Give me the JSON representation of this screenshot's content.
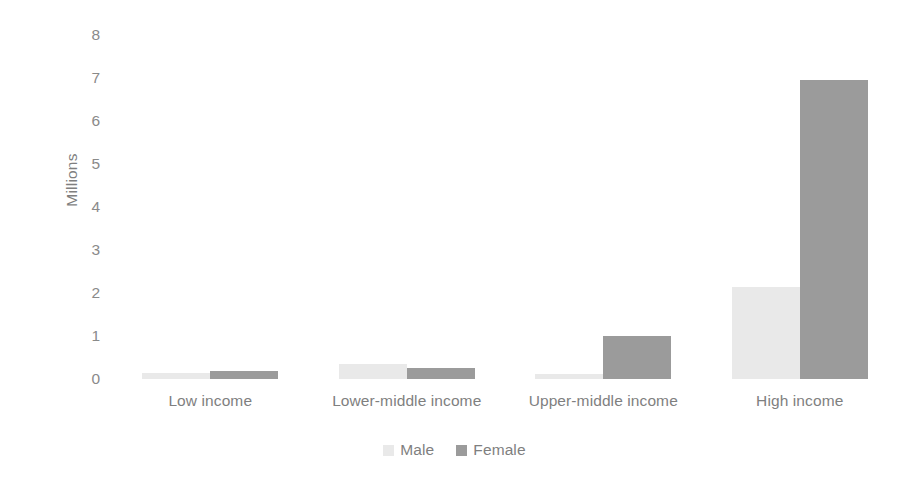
{
  "chart_data": {
    "type": "bar",
    "title": "",
    "subtitle": "",
    "xlabel": "",
    "ylabel": "Millions",
    "ylim": [
      0,
      8
    ],
    "yticks": [
      0,
      1,
      2,
      3,
      4,
      5,
      6,
      7,
      8
    ],
    "ytick_labels": [
      "0",
      "1",
      "2",
      "3",
      "4",
      "5",
      "6",
      "7",
      "8"
    ],
    "grid": false,
    "legend_position": "bottom-center",
    "categories": [
      "Low income",
      "Lower-middle income",
      "Upper-middle income",
      "High income"
    ],
    "series": [
      {
        "name": "Male",
        "color": "#e9e9e9",
        "values": [
          0.13,
          0.35,
          0.12,
          2.15
        ]
      },
      {
        "name": "Female",
        "color": "#9b9b9b",
        "values": [
          0.18,
          0.25,
          1.0,
          6.95
        ]
      }
    ]
  },
  "colors": {
    "male": "#e9e9e9",
    "female": "#9b9b9b",
    "text": "#7f7f7f",
    "tick_text": "#8a8a8a",
    "background": "#ffffff"
  },
  "axis": {
    "y_title": "Millions"
  },
  "legend": {
    "entries": [
      {
        "label": "Male",
        "color": "#e9e9e9"
      },
      {
        "label": "Female",
        "color": "#9b9b9b"
      }
    ]
  }
}
